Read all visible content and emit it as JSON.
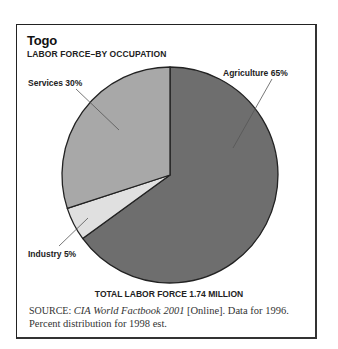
{
  "header": {
    "title": "Togo",
    "subtitle": "LABOR FORCE–BY OCCUPATION"
  },
  "labels": {
    "agriculture": "Agriculture 65%",
    "services": "Services 30%",
    "industry": "Industry 5%"
  },
  "footer": {
    "total": "TOTAL LABOR FORCE 1.74 MILLION",
    "source_prefix": "SOURCE:",
    "source_title": "CIA World Factbook 2001",
    "source_rest": " [Online]. Data for 1996. Percent distribution for 1998 est."
  },
  "colors": {
    "agriculture": "#6e6e6e",
    "industry": "#e0e0e0",
    "services": "#a8a8a8",
    "outline": "#222222"
  },
  "chart_data": {
    "type": "pie",
    "title": "Togo",
    "subtitle": "LABOR FORCE–BY OCCUPATION",
    "categories": [
      "Agriculture",
      "Industry",
      "Services"
    ],
    "values": [
      65,
      5,
      30
    ],
    "unit": "%",
    "labels": [
      "Agriculture 65%",
      "Industry 5%",
      "Services 30%"
    ],
    "start_angle": "12 o'clock, clockwise",
    "annotation": "TOTAL LABOR FORCE 1.74 MILLION",
    "source": "SOURCE: CIA World Factbook 2001 [Online]. Data for 1996. Percent distribution for 1998 est."
  }
}
